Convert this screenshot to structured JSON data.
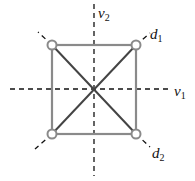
{
  "diagram": {
    "colors": {
      "square": "#8a8a8a",
      "axes": "#111111",
      "vertex": "#8a8a8a"
    },
    "labels": [
      {
        "id": "v2",
        "base": "v",
        "sub": "2"
      },
      {
        "id": "d1",
        "base": "d",
        "sub": "1"
      },
      {
        "id": "v1",
        "base": "v",
        "sub": "1"
      },
      {
        "id": "d2",
        "base": "d",
        "sub": "2"
      }
    ]
  }
}
